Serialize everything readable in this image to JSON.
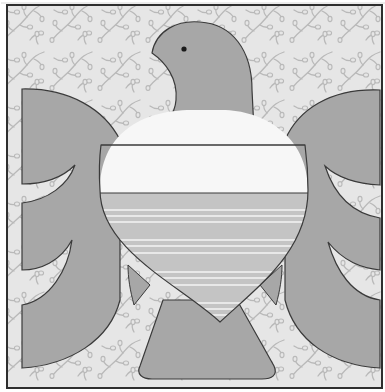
{
  "artwork": {
    "title": "",
    "subject": "bird-quilt-block",
    "colors": {
      "background": "#e6e6e6",
      "pattern": "#b9b9b9",
      "bird": "#a7a7a7",
      "outline": "#3a3a3a",
      "band_white": "#f7f7f7",
      "band_striped": "#c4c4c4",
      "stripe": "#f4f4f4",
      "eye": "#1a1a1a",
      "frame": "#2e2e2e"
    }
  }
}
